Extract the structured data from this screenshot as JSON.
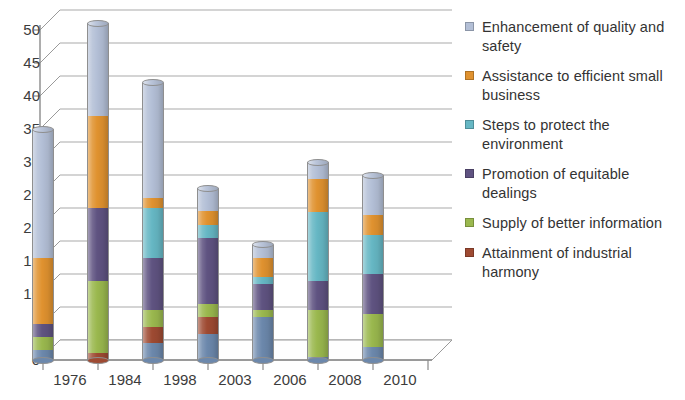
{
  "chart_data": {
    "type": "bar",
    "subtype": "stacked-column-3d",
    "title": "",
    "subtitle": "",
    "xlabel": "",
    "ylabel": "",
    "categories": [
      "1976",
      "1984",
      "1998",
      "2003",
      "2006",
      "2008",
      "2010"
    ],
    "ylim": [
      0,
      52
    ],
    "yticks": [
      0,
      5,
      10,
      15,
      20,
      25,
      30,
      35,
      40,
      45,
      50
    ],
    "ytick_labels": [
      "0",
      "5",
      "10",
      "15",
      "20",
      "25",
      "30",
      "35",
      "40",
      "45",
      "50"
    ],
    "grid": true,
    "legend_position": "right",
    "stack_order_bottom_to_top": [
      "Unlabelled base",
      "Attainment of industrial harmony",
      "Supply of better information",
      "Promotion of equitable dealings",
      "Steps to protect the environment",
      "Assistance to efficient small business",
      "Enhancement of quality and safety"
    ],
    "series": [
      {
        "name": "Enhancement of quality and safety",
        "color": "#b3bfd6",
        "values": [
          19.5,
          14.0,
          17.5,
          3.5,
          2.0,
          2.5,
          6.0
        ]
      },
      {
        "name": "Assistance to efficient small business",
        "color": "#e0922f",
        "values": [
          10.0,
          14.0,
          1.5,
          2.0,
          3.0,
          5.0,
          3.0
        ]
      },
      {
        "name": "Steps to protect the environment",
        "color": "#66b7c4",
        "values": [
          0.0,
          0.0,
          7.5,
          2.0,
          1.0,
          10.5,
          6.0
        ]
      },
      {
        "name": "Promotion of equitable dealings",
        "color": "#5f5381",
        "values": [
          2.0,
          11.0,
          8.0,
          10.0,
          4.0,
          4.5,
          6.0
        ]
      },
      {
        "name": "Supply of better information",
        "color": "#9ab84e",
        "values": [
          2.0,
          11.0,
          2.5,
          2.0,
          1.0,
          7.0,
          5.0
        ]
      },
      {
        "name": "Attainment of industrial harmony",
        "color": "#9e4a32",
        "values": [
          0.0,
          1.0,
          2.5,
          2.5,
          0.0,
          0.0,
          0.0
        ]
      },
      {
        "name": "Unlabelled base",
        "color": "#6c88ac",
        "values": [
          1.5,
          0.0,
          2.5,
          4.0,
          6.5,
          0.5,
          2.0
        ]
      }
    ],
    "totals": [
      35,
      51,
      42,
      26,
      17.5,
      30,
      28
    ]
  },
  "axes": {
    "y_tick_labels": [
      "50",
      "45",
      "40",
      "35",
      "30",
      "25",
      "20",
      "15",
      "10",
      "5",
      "0"
    ],
    "x_tick_labels": [
      "1976",
      "1984",
      "1998",
      "2003",
      "2006",
      "2008",
      "2010"
    ]
  },
  "legend": {
    "items": [
      {
        "label": "Enhancement of quality and safety",
        "color": "#b3bfd6"
      },
      {
        "label": "Assistance to efficient small business",
        "color": "#e0922f"
      },
      {
        "label": "Steps to protect the environment",
        "color": "#66b7c4"
      },
      {
        "label": "Promotion of equitable dealings",
        "color": "#5f5381"
      },
      {
        "label": "Supply of better information",
        "color": "#9ab84e"
      },
      {
        "label": "Attainment of industrial harmony",
        "color": "#9e4a32"
      }
    ]
  },
  "style": {
    "background": "#ffffff",
    "gridline_color": "#a9a9a9",
    "axis_color": "#8a8a8a",
    "text_color": "#3c3c3c"
  }
}
